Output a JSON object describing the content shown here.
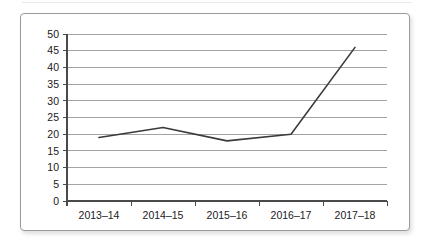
{
  "figure": {
    "background_color": "#ffffff",
    "border_color": "#9a9a9a"
  },
  "chart_data": {
    "type": "line",
    "title": "",
    "subtitle": "",
    "xlabel": "",
    "ylabel": "",
    "categories": [
      "2013–14",
      "2014–15",
      "2015–16",
      "2016–17",
      "2017–18"
    ],
    "values": [
      19,
      22,
      18,
      20,
      46
    ],
    "series": [
      {
        "name": "",
        "values": [
          19,
          22,
          18,
          20,
          46
        ],
        "color": "#3a3a3a",
        "line_width": 1.6,
        "markers": false
      }
    ],
    "ylim": [
      0,
      50
    ],
    "yticks": [
      0,
      5,
      10,
      15,
      20,
      25,
      30,
      35,
      40,
      45,
      50
    ],
    "ytick_labels": [
      "0",
      "5",
      "10",
      "15",
      "20",
      "25",
      "30",
      "35",
      "40",
      "45",
      "50"
    ],
    "grid": {
      "horizontal": true,
      "vertical": false,
      "color": "#8c8c8c"
    },
    "legend": {
      "visible": false,
      "position": "none"
    },
    "axis_color": "#4a4a4a"
  }
}
